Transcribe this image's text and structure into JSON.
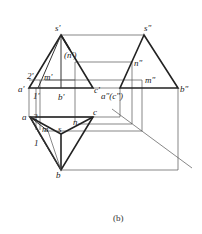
{
  "figure": {
    "caption": "(b)",
    "front_view": {
      "labels": {
        "s": "s'",
        "n": "(n')",
        "two": "2'",
        "m": "m'",
        "a": "a'",
        "one": "1'",
        "b": "b'",
        "c": "c'"
      }
    },
    "side_view": {
      "labels": {
        "s": "s\"",
        "n": "n\"",
        "m": "m\"",
        "a_c": "a\"(c\")",
        "b": "b\""
      }
    },
    "top_view": {
      "labels": {
        "a": "a",
        "two": "2",
        "c": "c",
        "n": "n",
        "m": "m",
        "s": "s",
        "one": "1",
        "b": "b"
      }
    }
  }
}
